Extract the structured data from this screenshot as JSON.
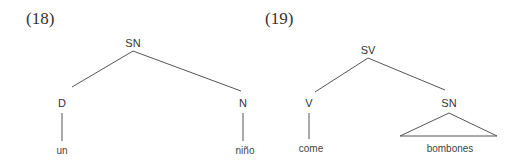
{
  "trees": [
    {
      "label": "(18)",
      "root": "SN",
      "children": [
        {
          "label": "D",
          "leaf": "un"
        },
        {
          "label": "N",
          "leaf": "niño"
        }
      ]
    },
    {
      "label": "(19)",
      "root": "SV",
      "children": [
        {
          "label": "V",
          "leaf": "come"
        },
        {
          "label": "SN",
          "leaf": "bombones",
          "triangle": true
        }
      ]
    }
  ]
}
